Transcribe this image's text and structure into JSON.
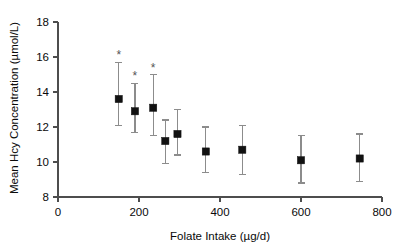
{
  "chart_data": {
    "type": "scatter",
    "title": "",
    "xlabel": "Folate Intake (µg/d)",
    "ylabel": "Mean Hcy Concentration (µmol/L)",
    "xlim": [
      0,
      800
    ],
    "ylim": [
      8,
      18
    ],
    "xticks": [
      0,
      200,
      400,
      600,
      800
    ],
    "xticklabels": [
      "0",
      "200",
      "400",
      "600",
      "800"
    ],
    "yticks": [
      8,
      10,
      12,
      14,
      16,
      18
    ],
    "yticklabels": [
      "8",
      "10",
      "12",
      "14",
      "16",
      "18"
    ],
    "grid": false,
    "legend": "none",
    "marker_style": "filled-square",
    "marker_color": "#111111",
    "errorbar_color": "#8c8c8c",
    "annotation_symbol": "*",
    "x": [
      150,
      190,
      235,
      265,
      295,
      365,
      455,
      600,
      745
    ],
    "y": [
      13.6,
      12.9,
      13.1,
      11.2,
      11.6,
      10.6,
      10.7,
      10.1,
      10.2
    ],
    "y_lower": [
      12.1,
      11.7,
      11.5,
      9.9,
      10.4,
      9.4,
      9.3,
      8.8,
      8.9
    ],
    "y_upper": [
      15.7,
      14.5,
      15.0,
      12.4,
      13.0,
      12.0,
      12.1,
      11.5,
      11.6
    ],
    "significant": [
      true,
      true,
      true,
      false,
      false,
      false,
      false,
      false,
      false
    ],
    "points": [
      {
        "x": 150,
        "y": 13.6,
        "low": 12.1,
        "high": 15.7,
        "star": "*"
      },
      {
        "x": 190,
        "y": 12.9,
        "low": 11.7,
        "high": 14.5,
        "star": "*"
      },
      {
        "x": 235,
        "y": 13.1,
        "low": 11.5,
        "high": 15.0,
        "star": "*"
      },
      {
        "x": 265,
        "y": 11.2,
        "low": 9.9,
        "high": 12.4,
        "star": ""
      },
      {
        "x": 295,
        "y": 11.6,
        "low": 10.4,
        "high": 13.0,
        "star": ""
      },
      {
        "x": 365,
        "y": 10.6,
        "low": 9.4,
        "high": 12.0,
        "star": ""
      },
      {
        "x": 455,
        "y": 10.7,
        "low": 9.3,
        "high": 12.1,
        "star": ""
      },
      {
        "x": 600,
        "y": 10.1,
        "low": 8.8,
        "high": 11.5,
        "star": ""
      },
      {
        "x": 745,
        "y": 10.2,
        "low": 8.9,
        "high": 11.6,
        "star": ""
      }
    ]
  }
}
